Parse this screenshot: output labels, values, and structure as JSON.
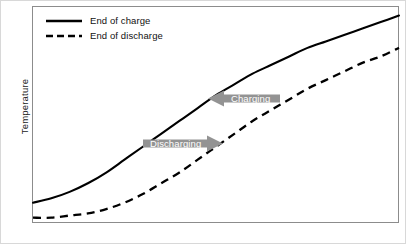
{
  "chart_data": {
    "type": "line",
    "title": "",
    "xlabel": "",
    "ylabel": "Temperature",
    "grid": false,
    "axis_ticks": false,
    "legend_position": "top-left",
    "xlim": [
      0,
      100
    ],
    "ylim": [
      0,
      100
    ],
    "series": [
      {
        "name": "End of charge",
        "style": "solid",
        "color": "#000000",
        "x": [
          0,
          5,
          10,
          15,
          20,
          25,
          30,
          35,
          40,
          45,
          50,
          55,
          60,
          65,
          70,
          75,
          80,
          85,
          90,
          95,
          100
        ],
        "y": [
          9,
          11,
          14,
          18,
          23,
          29,
          35,
          41,
          47,
          53,
          59,
          64,
          69,
          73,
          77,
          81,
          84,
          87,
          90,
          93,
          96
        ]
      },
      {
        "name": "End of discharge",
        "style": "dashed",
        "color": "#000000",
        "x": [
          0,
          5,
          10,
          15,
          20,
          25,
          30,
          35,
          40,
          45,
          50,
          55,
          60,
          65,
          70,
          75,
          80,
          85,
          90,
          95,
          100
        ],
        "y": [
          2,
          2,
          3,
          4,
          6,
          9,
          13,
          18,
          23,
          29,
          35,
          41,
          47,
          52,
          57,
          62,
          66,
          70,
          74,
          77,
          81
        ]
      }
    ],
    "annotations": [
      {
        "label": "Charging",
        "direction": "left",
        "color": "#939393",
        "text_color": "#ffffff"
      },
      {
        "label": "Discharging",
        "direction": "right",
        "color": "#939393",
        "text_color": "#ffffff"
      }
    ]
  },
  "legend": {
    "items": [
      {
        "label": "End of charge",
        "style": "solid"
      },
      {
        "label": "End of discharge",
        "style": "dashed"
      }
    ]
  },
  "axes": {
    "y_title": "Temperature",
    "x_title": ""
  },
  "colors": {
    "frame": "#8c8c8c",
    "curve": "#000000",
    "annotation_fill": "#939393",
    "annotation_text": "#ffffff",
    "background": "#ffffff"
  }
}
